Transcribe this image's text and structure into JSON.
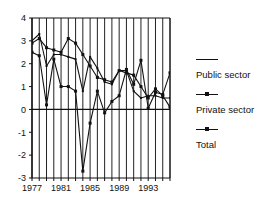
{
  "chart_data": {
    "type": "line",
    "title": "",
    "subtitle": "",
    "xlabel": "",
    "ylabel": "",
    "xlim": [
      1977,
      1996
    ],
    "ylim": [
      -3,
      4
    ],
    "yticks": [
      4,
      3,
      2,
      1,
      0,
      -1,
      -2,
      -3
    ],
    "xticks": [
      1977,
      1981,
      1985,
      1989,
      1993
    ],
    "x": [
      1977,
      1978,
      1979,
      1980,
      1981,
      1982,
      1983,
      1984,
      1985,
      1986,
      1987,
      1988,
      1989,
      1990,
      1991,
      1992,
      1993,
      1994,
      1995,
      1996
    ],
    "grid": "vertical",
    "zero_line": true,
    "legend_position": "right",
    "series": [
      {
        "name": "Public sector",
        "marker": "line",
        "values": [
          3.0,
          3.3,
          1.9,
          2.4,
          2.4,
          2.3,
          2.2,
          0.8,
          2.3,
          1.8,
          1.2,
          1.1,
          1.7,
          1.7,
          0.8,
          0.5,
          0.6,
          0.6,
          0.5,
          0.5
        ]
      },
      {
        "name": "Private sector",
        "marker": "square",
        "values": [
          2.9,
          3.1,
          2.7,
          2.6,
          2.5,
          3.1,
          2.9,
          2.4,
          1.9,
          1.4,
          1.3,
          1.2,
          1.7,
          1.6,
          1.5,
          1.0,
          0.5,
          0.9,
          0.6,
          0.1
        ]
      },
      {
        "name": "Total",
        "marker": "square",
        "values": [
          2.5,
          2.35,
          0.2,
          2.2,
          1.0,
          1.0,
          0.8,
          -2.7,
          -0.6,
          0.8,
          -0.15,
          0.35,
          0.6,
          1.75,
          1.1,
          2.15,
          0.05,
          0.75,
          0.65,
          1.6
        ]
      }
    ],
    "legend_entries": [
      "Public sector",
      "Private sector",
      "Total"
    ],
    "colors": {
      "line": "#111111",
      "grid": "#222222",
      "axis": "#111111",
      "background": "#ffffff"
    }
  }
}
